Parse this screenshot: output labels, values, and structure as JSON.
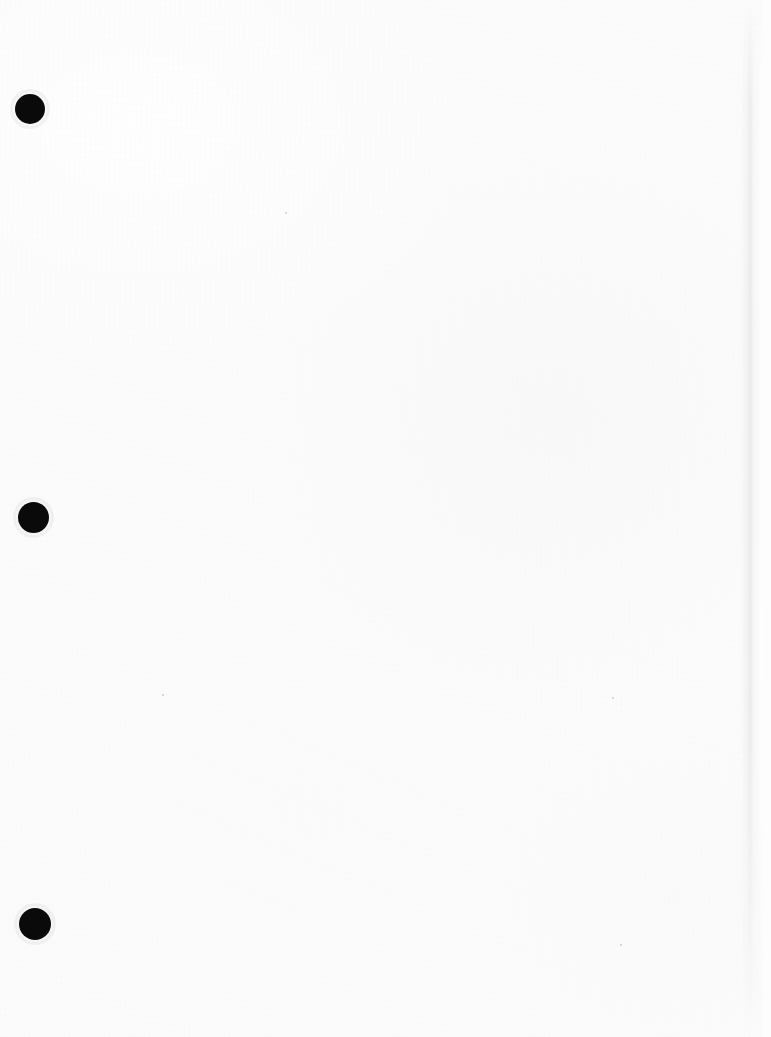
{
  "document": {
    "kind": "scanned-page",
    "description": "Blank scanned sheet of paper",
    "page_width": 771,
    "page_height": 1037,
    "paper_color": "#fbfbfb",
    "content_text": "",
    "has_text": false
  },
  "binding": {
    "label": "three-hole punch margin",
    "hole_color": "#0a0a0a",
    "hole_count": 3,
    "holes": [
      {
        "name": "hole-punch-top",
        "cx": 30,
        "cy": 109,
        "diameter": 30
      },
      {
        "name": "hole-punch-middle",
        "cx": 33,
        "cy": 517,
        "diameter": 31
      },
      {
        "name": "hole-punch-bottom",
        "cx": 35,
        "cy": 924,
        "diameter": 32
      }
    ]
  },
  "page_edge": {
    "label": "right page edge",
    "x": 741,
    "width": 22,
    "edge_color": "#e4e4e8",
    "outside_color": "#fdfdfd"
  },
  "specks": [
    {
      "name": "speck-upper-center",
      "x": 285,
      "y": 212,
      "size": 2
    },
    {
      "name": "speck-mid-left",
      "x": 162,
      "y": 694,
      "size": 2
    },
    {
      "name": "speck-right-upper",
      "x": 612,
      "y": 697,
      "size": 2
    },
    {
      "name": "speck-lower-right",
      "x": 620,
      "y": 944,
      "size": 2
    }
  ]
}
